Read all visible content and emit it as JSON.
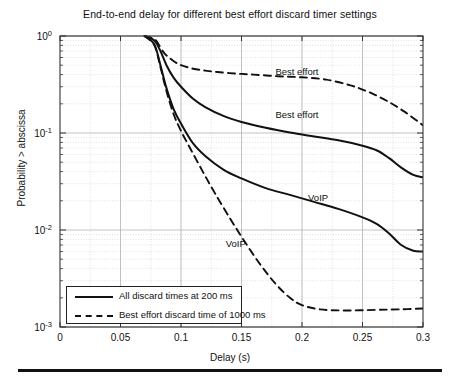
{
  "chart_data": {
    "type": "line",
    "title": "End-to-end delay for different best effort discard timer settings",
    "xlabel": "Delay (s)",
    "ylabel": "Probability > abscissa",
    "xlim": [
      0,
      0.3
    ],
    "ylim": [
      0.001,
      1
    ],
    "yscale": "log",
    "xticks": [
      "0",
      "0.05",
      "0.1",
      "0.15",
      "0.2",
      "0.25",
      "0.3"
    ],
    "xtick_values": [
      0,
      0.05,
      0.1,
      0.15,
      0.2,
      0.25,
      0.3
    ],
    "ytick_labels": [
      "10",
      "10",
      "10",
      "10"
    ],
    "ytick_exponents": [
      "0",
      "-1",
      "-2",
      "-3"
    ],
    "ytick_values": [
      1,
      0.1,
      0.01,
      0.001
    ],
    "grid": true,
    "grid_minor": true,
    "legend_position": "lower left",
    "series": [
      {
        "name": "Best effort (1000 ms discard)",
        "style": "dashed",
        "annotation": "Best effort",
        "x": [
          0.07,
          0.078,
          0.082,
          0.086,
          0.09,
          0.095,
          0.1,
          0.11,
          0.12,
          0.13,
          0.145,
          0.16,
          0.18,
          0.2,
          0.22,
          0.24,
          0.255,
          0.27,
          0.285,
          0.3
        ],
        "y": [
          1.0,
          0.93,
          0.8,
          0.67,
          0.6,
          0.54,
          0.5,
          0.46,
          0.44,
          0.425,
          0.41,
          0.4,
          0.385,
          0.375,
          0.355,
          0.31,
          0.265,
          0.215,
          0.165,
          0.12
        ]
      },
      {
        "name": "Best effort (200 ms discard)",
        "style": "solid",
        "annotation": "Best effort",
        "x": [
          0.07,
          0.078,
          0.083,
          0.088,
          0.094,
          0.1,
          0.11,
          0.12,
          0.135,
          0.15,
          0.17,
          0.19,
          0.21,
          0.23,
          0.25,
          0.262,
          0.272,
          0.282,
          0.292,
          0.3
        ],
        "y": [
          1.0,
          0.9,
          0.7,
          0.5,
          0.37,
          0.3,
          0.225,
          0.185,
          0.15,
          0.13,
          0.113,
          0.101,
          0.092,
          0.084,
          0.074,
          0.066,
          0.055,
          0.044,
          0.037,
          0.035
        ]
      },
      {
        "name": "VoIP (200 ms discard)",
        "style": "solid",
        "annotation": "VoIP",
        "x": [
          0.07,
          0.078,
          0.083,
          0.088,
          0.094,
          0.1,
          0.11,
          0.12,
          0.135,
          0.15,
          0.17,
          0.19,
          0.21,
          0.23,
          0.25,
          0.262,
          0.272,
          0.282,
          0.292,
          0.3
        ],
        "y": [
          1.0,
          0.82,
          0.5,
          0.29,
          0.175,
          0.125,
          0.078,
          0.058,
          0.042,
          0.034,
          0.027,
          0.023,
          0.0195,
          0.0165,
          0.0135,
          0.0115,
          0.0092,
          0.007,
          0.0061,
          0.006
        ]
      },
      {
        "name": "VoIP (1000 ms discard)",
        "style": "dashed",
        "annotation": "VoIP",
        "x": [
          0.07,
          0.078,
          0.083,
          0.088,
          0.094,
          0.1,
          0.108,
          0.118,
          0.128,
          0.14,
          0.152,
          0.165,
          0.178,
          0.19,
          0.2,
          0.215,
          0.235,
          0.26,
          0.28,
          0.3
        ],
        "y": [
          1.0,
          0.8,
          0.48,
          0.27,
          0.155,
          0.105,
          0.068,
          0.04,
          0.024,
          0.0135,
          0.0078,
          0.0045,
          0.0028,
          0.002,
          0.00168,
          0.00152,
          0.00148,
          0.0015,
          0.00152,
          0.00155
        ]
      }
    ],
    "annotations": [
      {
        "text": "Best effort",
        "x": 0.178,
        "y": 0.425,
        "series": "Best effort (1000 ms discard)"
      },
      {
        "text": "Best effort",
        "x": 0.178,
        "y": 0.155,
        "series": "Best effort (200 ms discard)"
      },
      {
        "text": "VoIP",
        "x": 0.205,
        "y": 0.0215,
        "series": "VoIP (200 ms discard)"
      },
      {
        "text": "VoIP",
        "x": 0.137,
        "y": 0.0072,
        "series": "VoIP (1000 ms discard)"
      }
    ],
    "legend": [
      {
        "label": "All discard times at 200 ms",
        "style": "solid"
      },
      {
        "label": "Best effort discard time of 1000 ms",
        "style": "dashed"
      }
    ]
  },
  "colors": {
    "line": "#111111",
    "grid_major": "#b4b4b4",
    "grid_minor": "#cfcfcf",
    "axis": "#333333",
    "background": "#ffffff"
  }
}
